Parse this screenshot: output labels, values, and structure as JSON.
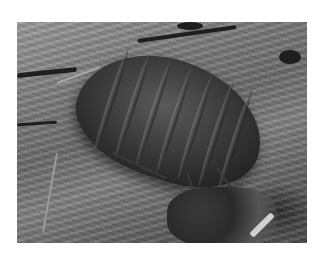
{
  "image": {
    "description": "Grayscale photograph of a woodlouse (pill bug) crawling on weathered wood and soil",
    "subject": "woodlouse",
    "background": "weathered wood and soil",
    "colors": {
      "page_bg": "#ffffff",
      "light_wood": "#9a9a9a",
      "mid_tone": "#6a6a6a",
      "shell_dark": "#222222"
    }
  }
}
